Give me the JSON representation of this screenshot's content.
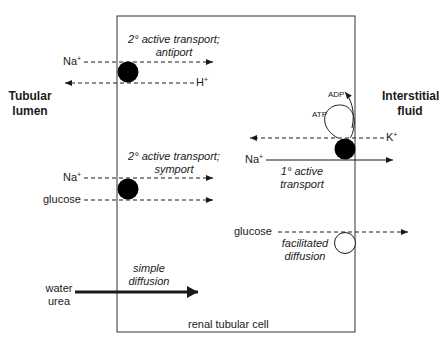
{
  "diagram": {
    "regions": {
      "left": "Tubular lumen",
      "left_line1": "Tubular",
      "left_line2": "lumen",
      "right_line1": "Interstitial",
      "right_line2": "fluid",
      "cell": "renal tubular cell"
    },
    "antiport": {
      "mechanism_line1": "2° active transport;",
      "mechanism_line2": "antiport",
      "ion_in": "Na",
      "ion_in_charge": "+",
      "ion_out": "H",
      "ion_out_charge": "+"
    },
    "symport": {
      "mechanism_line1": "2° active transport;",
      "mechanism_line2": "symport",
      "ion": "Na",
      "ion_charge": "+",
      "cotransported": "glucose"
    },
    "primary_active": {
      "mechanism_line1": "1° active",
      "mechanism_line2": "transport",
      "ion_in": "K",
      "ion_in_charge": "+",
      "ion_out": "Na",
      "ion_out_charge": "+",
      "energy_in": "ATP",
      "energy_out": "ADP"
    },
    "facilitated": {
      "mechanism_line1": "facilitated",
      "mechanism_line2": "diffusion",
      "solute": "glucose"
    },
    "simple": {
      "mechanism_line1": "simple",
      "mechanism_line2": "diffusion",
      "solute1": "water",
      "solute2": "urea"
    },
    "colors": {
      "stroke": "#1a1a1a",
      "carrier_filled": "#000000",
      "carrier_open": "#ffffff"
    }
  }
}
